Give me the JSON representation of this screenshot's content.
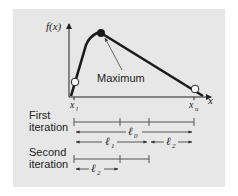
{
  "diagram": {
    "axes": {
      "y_label": "f(x)",
      "x_label": "x",
      "x_lower_label": "x",
      "x_lower_sub": "l",
      "x_upper_label": "x",
      "x_upper_sub": "u"
    },
    "annotation": "Maximum",
    "rows": [
      {
        "label_line1": "First",
        "label_line2": "iteration"
      },
      {
        "label_line1": "Second",
        "label_line2": "iteration"
      }
    ],
    "intervals": {
      "l0": {
        "symbol": "ℓ",
        "sub": "0"
      },
      "l1": {
        "symbol": "ℓ",
        "sub": "1"
      },
      "l2": {
        "symbol": "ℓ",
        "sub": "2"
      },
      "l2_second": {
        "symbol": "ℓ",
        "sub": "2"
      }
    },
    "colors": {
      "panel": "#e7e7e7",
      "ink": "#1a1a1a",
      "line": "#555555"
    }
  }
}
